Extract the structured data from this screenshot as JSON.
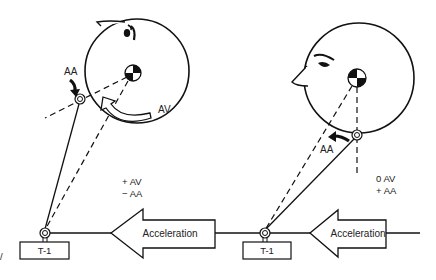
{
  "diagram": {
    "left_panel": {
      "head_orientation": "tilted-back (extension)",
      "rotation_arrow_label": "AV",
      "joint_arrow_label": "AA",
      "signs": [
        "+ AV",
        "− AA"
      ],
      "acceleration_label": "Acceleration",
      "vertebra_label": "T-1"
    },
    "right_panel": {
      "head_orientation": "upright, facing left",
      "joint_arrow_label": "AA",
      "signs": [
        "0  AV",
        "+ AA"
      ],
      "acceleration_label": "Acceleration",
      "vertebra_label": "T-1"
    },
    "edge_mark": "/",
    "colors": {
      "ink": "#111111",
      "background": "#ffffff"
    }
  }
}
